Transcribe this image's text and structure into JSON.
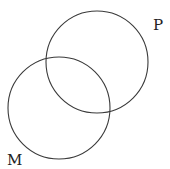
{
  "diagram": {
    "type": "venn",
    "sets": [
      {
        "id": "P",
        "label": "P",
        "cx": 97,
        "cy": 62,
        "r": 51,
        "label_x": 153,
        "label_y": 30
      },
      {
        "id": "M",
        "label": "M",
        "cx": 59,
        "cy": 108,
        "r": 51,
        "label_x": 7,
        "label_y": 165
      }
    ],
    "stroke_color": "#3a3a3a",
    "background": "#ffffff"
  }
}
